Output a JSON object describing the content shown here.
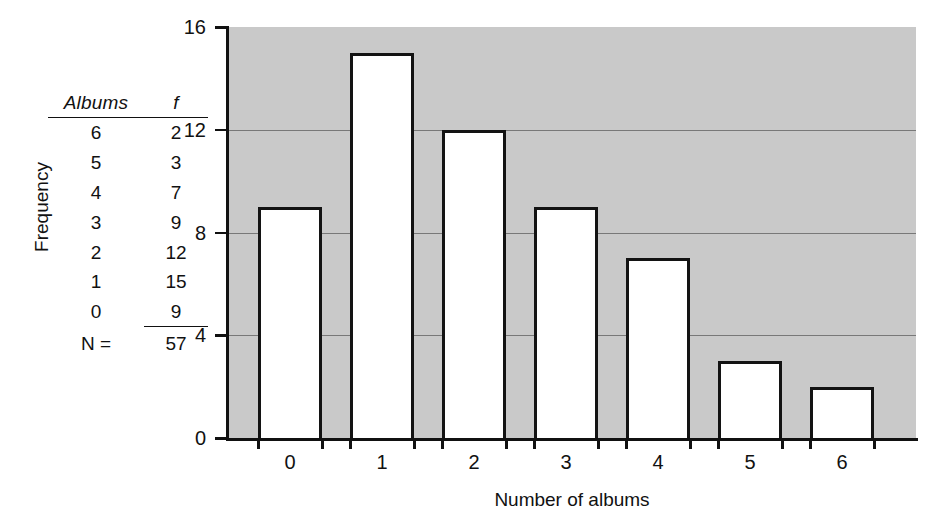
{
  "table": {
    "name": "frequency-distribution-table",
    "headers": [
      "Albums",
      "f"
    ],
    "rows": [
      {
        "albums": "6",
        "f": "2"
      },
      {
        "albums": "5",
        "f": "3"
      },
      {
        "albums": "4",
        "f": "7"
      },
      {
        "albums": "3",
        "f": "9"
      },
      {
        "albums": "2",
        "f": "12"
      },
      {
        "albums": "1",
        "f": "15"
      },
      {
        "albums": "0",
        "f": "9"
      }
    ],
    "total_label": "N =",
    "total_value": "57"
  },
  "chart_data": {
    "type": "bar",
    "title": "",
    "xlabel": "Number of albums",
    "ylabel": "Frequency",
    "categories": [
      "0",
      "1",
      "2",
      "3",
      "4",
      "5",
      "6"
    ],
    "values": [
      9,
      15,
      12,
      9,
      7,
      3,
      2
    ],
    "ylim": [
      0,
      16
    ],
    "yticks": [
      0,
      4,
      8,
      12,
      16
    ],
    "ytick_labels": [
      "0",
      "4",
      "8",
      "12",
      "16"
    ],
    "xtick_labels": [
      "0",
      "1",
      "2",
      "3",
      "4",
      "5",
      "6"
    ],
    "grid": true,
    "gridlines_at": [
      4,
      8,
      12
    ],
    "legend": "none",
    "plot_background_color": "#c9c9c9",
    "bar_fill_color": "#ffffff",
    "bar_edge_color": "#131313",
    "axis_color": "#111111"
  }
}
